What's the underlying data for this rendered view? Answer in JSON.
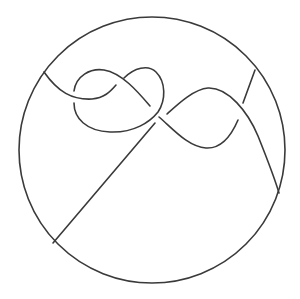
{
  "figure": {
    "type": "knot-diagram",
    "stroke_color": "#3a3a3a",
    "background": "#ffffff",
    "boundary": {
      "shape": "circle",
      "cx": 152,
      "cy": 150,
      "r": 133
    },
    "endpoints_on_boundary": [
      {
        "x": 44,
        "y": 72
      },
      {
        "x": 255,
        "y": 70
      },
      {
        "x": 279,
        "y": 193
      },
      {
        "x": 53,
        "y": 243
      }
    ],
    "crossings": 5
  }
}
